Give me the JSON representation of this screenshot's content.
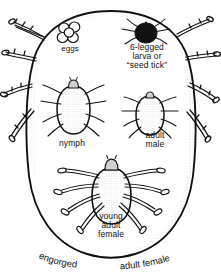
{
  "figure": {
    "colors": {
      "ink": "#111111",
      "background": "#ffffff",
      "stipple": "#7a7a7a",
      "larva_fill": "#111111"
    },
    "stages": [
      {
        "id": "eggs",
        "label": "eggs",
        "egg_count": 5
      },
      {
        "id": "larva",
        "label": "6-legged\nlarva or\n“seed tick”",
        "legs": 6
      },
      {
        "id": "nymph",
        "label": "nymph",
        "legs": 8
      },
      {
        "id": "male",
        "label": "adult\nmale",
        "legs": 8
      },
      {
        "id": "young_female",
        "label": "young\nadult\nfemale",
        "legs": 8
      }
    ],
    "caption": {
      "left_word": "engorged",
      "right_word": "adult  female",
      "full_text": "engorged adult female"
    }
  }
}
